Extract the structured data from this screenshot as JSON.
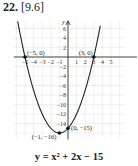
{
  "header": {
    "problem_number": "22.",
    "section_ref": "[9.6]"
  },
  "equation": "y = x² + 2x − 15",
  "chart_data": {
    "type": "line",
    "xlabel": "",
    "ylabel": "y",
    "xlim": [
      -5.5,
      6.2
    ],
    "ylim": [
      -17,
      7.5
    ],
    "grid": true,
    "x_ticks": [
      -5,
      -4,
      -3,
      -2,
      -1,
      1,
      2,
      3,
      4,
      5
    ],
    "y_ticks": [
      6,
      4,
      2,
      -2,
      -4,
      -6,
      -8,
      -10,
      -12,
      -14
    ],
    "series": [
      {
        "name": "y = x^2 + 2x - 15",
        "function": "x^2 + 2x - 15",
        "x": [
          -5.8,
          -5,
          -4,
          -3,
          -2,
          -1,
          0,
          1,
          2,
          3,
          3.7
        ],
        "values": [
          7.84,
          0,
          -7,
          -12,
          -15,
          -16,
          -15,
          -12,
          -7,
          0,
          6.09
        ]
      }
    ],
    "points": [
      {
        "label": "(−5, 0)",
        "x": -5,
        "y": 0
      },
      {
        "label": "(3, 0)",
        "x": 3,
        "y": 0
      },
      {
        "label": "(0, −15)",
        "x": 0,
        "y": -15
      },
      {
        "label": "(−1, −16)",
        "x": -1,
        "y": -16
      }
    ]
  }
}
